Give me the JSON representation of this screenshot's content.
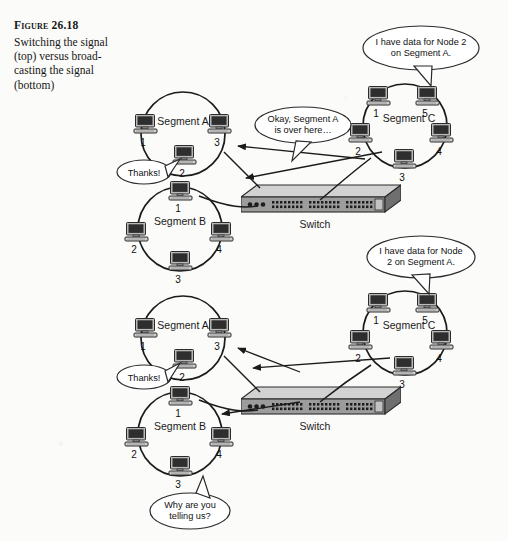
{
  "caption": {
    "figure_number": "Figure 26.18",
    "description": "Switching the signal (top) versus broad-casting the signal (bottom)"
  },
  "diagrams": [
    {
      "id": "top",
      "mode": "switching",
      "segments": [
        {
          "name": "Segment A",
          "nodes": [
            "1",
            "2",
            "3"
          ]
        },
        {
          "name": "Segment B",
          "nodes": [
            "1",
            "2",
            "3",
            "4"
          ]
        },
        {
          "name": "Segment C",
          "nodes": [
            "1",
            "2",
            "3",
            "4",
            "5"
          ]
        }
      ],
      "switch_label": "Switch",
      "bubbles": [
        {
          "id": "source",
          "lines": [
            "I have data for Node 2",
            "on Segment A."
          ]
        },
        {
          "id": "switch-reply",
          "lines": [
            "Okay, Segment A",
            "is over here…"
          ]
        },
        {
          "id": "ack",
          "lines": [
            "Thanks!"
          ]
        }
      ]
    },
    {
      "id": "bottom",
      "mode": "broadcasting",
      "segments": [
        {
          "name": "Segment A",
          "nodes": [
            "1",
            "2",
            "3"
          ]
        },
        {
          "name": "Segment B",
          "nodes": [
            "1",
            "2",
            "3",
            "4"
          ]
        },
        {
          "name": "Segment C",
          "nodes": [
            "1",
            "2",
            "3",
            "4",
            "5"
          ]
        }
      ],
      "switch_label": "Switch",
      "bubbles": [
        {
          "id": "source",
          "lines": [
            "I have data for Node",
            "2 on Segment A."
          ]
        },
        {
          "id": "ack",
          "lines": [
            "Thanks!"
          ]
        },
        {
          "id": "complaint",
          "lines": [
            "Why are you",
            "telling us?"
          ]
        }
      ]
    }
  ],
  "colors": {
    "ink": "#1b1b1b",
    "paper": "#fbfbf9",
    "device_body": "#9a9a9a",
    "device_top": "#c9c9c9",
    "screen": "#2b2b2b"
  },
  "icons": {
    "computer": "computer-icon",
    "switch": "network-switch-icon"
  }
}
